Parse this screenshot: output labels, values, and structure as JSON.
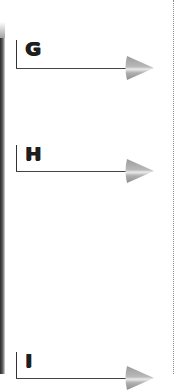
{
  "page": {
    "sections": [
      {
        "label": "G",
        "icon": "arrow-right-icon"
      },
      {
        "label": "H",
        "icon": "arrow-right-icon"
      },
      {
        "label": "I",
        "icon": "arrow-right-icon"
      }
    ],
    "colors": {
      "text": "#1e1e1e",
      "line": "#444444",
      "arrow": "#a8a8a8",
      "arrow_highlight": "#e8e8e8",
      "left_bar": "#2a2a2a",
      "dotted_border": "#8a8a8a"
    }
  }
}
